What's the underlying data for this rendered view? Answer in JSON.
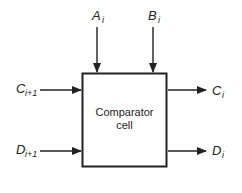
{
  "diagram": {
    "block": {
      "line1": "Comparator",
      "line2": "cell"
    },
    "inputs": {
      "a": {
        "main": "A",
        "sub": "i"
      },
      "b": {
        "main": "B",
        "sub": "i"
      },
      "c": {
        "main": "C",
        "sub": "i+1"
      },
      "d": {
        "main": "D",
        "sub": "i+1"
      }
    },
    "outputs": {
      "c": {
        "main": "C",
        "sub": "i"
      },
      "d": {
        "main": "D",
        "sub": "i"
      }
    }
  }
}
